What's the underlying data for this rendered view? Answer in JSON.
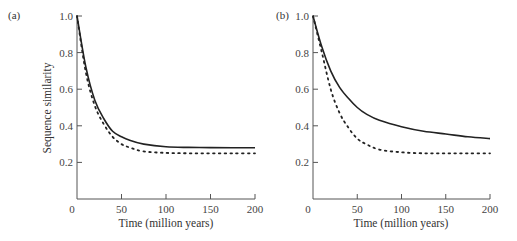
{
  "figure": {
    "panels": [
      {
        "label": "(a)",
        "xlabel": "Time (million years)",
        "ylabel": "Sequence similarity"
      },
      {
        "label": "(b)",
        "xlabel": "Time (million years)",
        "ylabel": ""
      }
    ]
  },
  "chart_data": [
    {
      "type": "line",
      "title": "(a)",
      "xlabel": "Time (million years)",
      "ylabel": "Sequence similarity",
      "xlim": [
        0,
        200
      ],
      "ylim": [
        0,
        1.0
      ],
      "xticks": [
        0,
        50,
        100,
        150,
        200
      ],
      "yticks": [
        0.2,
        0.4,
        0.6,
        0.8,
        1.0
      ],
      "grid": false,
      "x": [
        0,
        10,
        20,
        30,
        40,
        50,
        60,
        75,
        100,
        125,
        150,
        175,
        200
      ],
      "series": [
        {
          "name": "solid",
          "style": "solid",
          "values": [
            1.0,
            0.72,
            0.54,
            0.44,
            0.37,
            0.34,
            0.32,
            0.3,
            0.285,
            0.282,
            0.281,
            0.28,
            0.28
          ]
        },
        {
          "name": "dotted",
          "style": "dotted",
          "values": [
            1.0,
            0.69,
            0.51,
            0.41,
            0.34,
            0.3,
            0.28,
            0.26,
            0.252,
            0.25,
            0.25,
            0.25,
            0.25
          ]
        }
      ]
    },
    {
      "type": "line",
      "title": "(b)",
      "xlabel": "Time (million years)",
      "ylabel": "",
      "xlim": [
        0,
        200
      ],
      "ylim": [
        0,
        1.0
      ],
      "xticks": [
        0,
        50,
        100,
        150,
        200
      ],
      "yticks": [
        0.2,
        0.4,
        0.6,
        0.8,
        1.0
      ],
      "grid": false,
      "x": [
        0,
        10,
        20,
        30,
        40,
        50,
        60,
        75,
        100,
        125,
        150,
        175,
        200
      ],
      "series": [
        {
          "name": "solid",
          "style": "solid",
          "values": [
            1.0,
            0.83,
            0.7,
            0.61,
            0.55,
            0.5,
            0.465,
            0.43,
            0.395,
            0.37,
            0.355,
            0.34,
            0.33
          ]
        },
        {
          "name": "dotted",
          "style": "dotted",
          "values": [
            1.0,
            0.8,
            0.6,
            0.47,
            0.39,
            0.33,
            0.3,
            0.27,
            0.255,
            0.25,
            0.25,
            0.25,
            0.25
          ]
        }
      ]
    }
  ]
}
